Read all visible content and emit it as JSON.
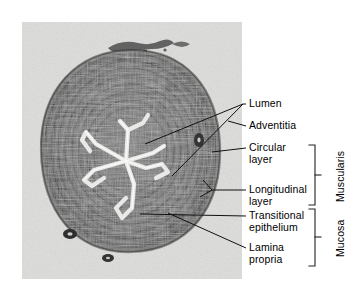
{
  "figure": {
    "kind": "histology-micrograph",
    "background_color": "#ffffff",
    "plate_color": "#d9d9d8",
    "tissue_color": "#4a4a4a",
    "lumen_color": "#e8e8e6",
    "line_color": "#111111"
  },
  "labels": [
    {
      "id": "lumen",
      "line1": "Lumen",
      "line2": ""
    },
    {
      "id": "adventitia",
      "line1": "Adventitia",
      "line2": ""
    },
    {
      "id": "circular-layer",
      "line1": "Circular",
      "line2": "layer"
    },
    {
      "id": "longitudinal-layer",
      "line1": "Longitudinal",
      "line2": "layer"
    },
    {
      "id": "transitional-epithelium",
      "line1": "Transitional",
      "line2": "epithelium"
    },
    {
      "id": "lamina-propria",
      "line1": "Lamina",
      "line2": "propria"
    }
  ],
  "brackets": [
    {
      "id": "muscularis",
      "name": "Muscularis"
    },
    {
      "id": "mucosa",
      "name": "Mucosa"
    }
  ]
}
